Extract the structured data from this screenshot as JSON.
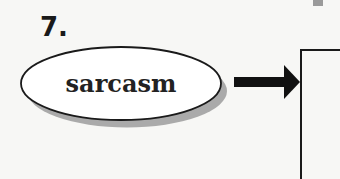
{
  "item": {
    "number": "7.",
    "term": "sarcasm"
  },
  "diagram": {
    "shape": "ellipse-with-drop-shadow",
    "connector": "right-arrow",
    "target": "answer-box",
    "colors": {
      "background": "#f7f7f5",
      "ink": "#1a1a1a",
      "ellipse_fill": "#ffffff",
      "shadow": "#9c9c9c",
      "corner_mark": "#9a9a9a"
    }
  }
}
